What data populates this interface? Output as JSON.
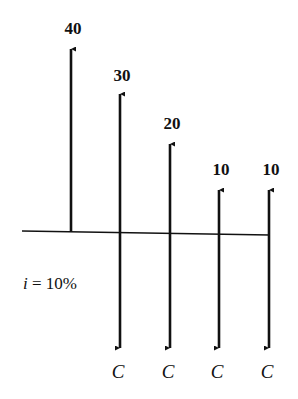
{
  "diagram": {
    "type": "cash-flow-diagram",
    "interest_rate_label": "i = 10%",
    "interest_rate": "10%",
    "axis": {
      "x_start": 22,
      "x_end": 270,
      "y_start": 231,
      "y_end": 235
    },
    "periods": [
      {
        "x": 71,
        "receipt": {
          "label": "40",
          "tip_y": 47,
          "label_y": 34
        },
        "cost": null
      },
      {
        "x": 120,
        "receipt": {
          "label": "30",
          "tip_y": 92,
          "label_y": 81
        },
        "cost": {
          "label": "C",
          "tip_y": 350,
          "label_y": 378
        }
      },
      {
        "x": 170,
        "receipt": {
          "label": "20",
          "tip_y": 142,
          "label_y": 129
        },
        "cost": {
          "label": "C",
          "tip_y": 350,
          "label_y": 378
        }
      },
      {
        "x": 219,
        "receipt": {
          "label": "10",
          "tip_y": 188,
          "label_y": 175
        },
        "cost": {
          "label": "C",
          "tip_y": 350,
          "label_y": 378
        }
      },
      {
        "x": 269,
        "receipt": {
          "label": "10",
          "tip_y": 188,
          "label_y": 175
        },
        "cost": {
          "label": "C",
          "tip_y": 350,
          "label_y": 378
        }
      }
    ],
    "colors": {
      "stroke": "#111111",
      "background": "#ffffff"
    }
  }
}
